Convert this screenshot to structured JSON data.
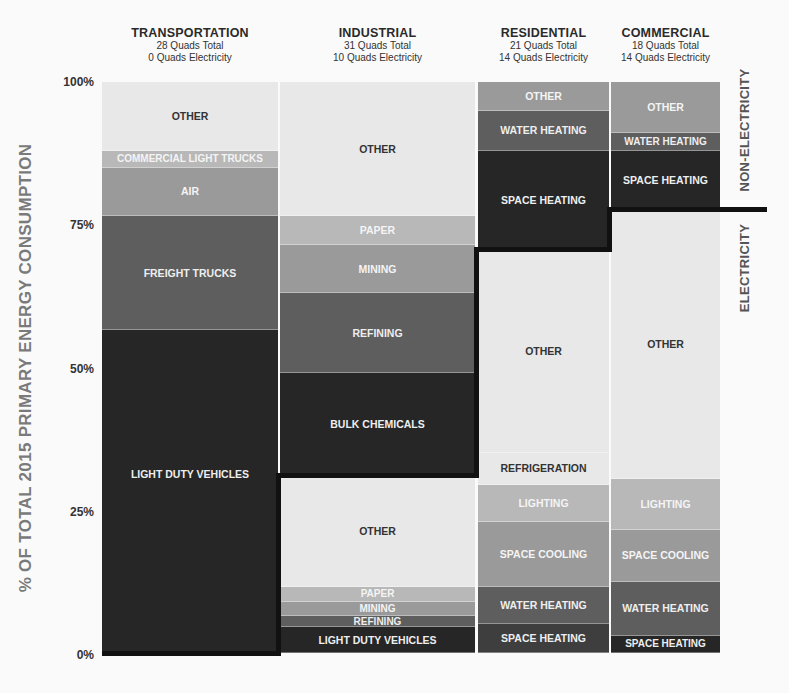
{
  "chart_data": {
    "type": "bar",
    "subtype": "marimekko (variable-width 100% stacked)",
    "title": "",
    "ylabel": "% OF TOTAL 2015 PRIMARY ENERGY CONSUMPTION",
    "xlabel": "",
    "ylim": [
      0,
      100
    ],
    "y_ticks": [
      "100%",
      "75%",
      "50%",
      "25%",
      "0%"
    ],
    "grid": false,
    "side_labels": {
      "upper": "NON-ELECTRICITY",
      "lower": "ELECTRICITY"
    },
    "categories": [
      "TRANSPORTATION",
      "INDUSTRIAL",
      "RESIDENTIAL",
      "COMMERCIAL"
    ],
    "columns": [
      {
        "name": "TRANSPORTATION",
        "total_label": "28 Quads Total",
        "electricity_label": "0 Quads Electricity",
        "total_quads": 28,
        "electricity_quads": 0,
        "electricity_split_pct": 0,
        "segments": [
          {
            "label": "OTHER",
            "group": "non-electricity",
            "from": 88,
            "to": 100
          },
          {
            "label": "COMMERCIAL LIGHT TRUCKS",
            "group": "non-electricity",
            "from": 85,
            "to": 88
          },
          {
            "label": "AIR",
            "group": "non-electricity",
            "from": 76.5,
            "to": 85
          },
          {
            "label": "FREIGHT TRUCKS",
            "group": "non-electricity",
            "from": 56.5,
            "to": 76.5
          },
          {
            "label": "LIGHT DUTY VEHICLES",
            "group": "non-electricity",
            "from": 0,
            "to": 56.5
          }
        ]
      },
      {
        "name": "INDUSTRIAL",
        "total_label": "31 Quads Total",
        "electricity_label": "10 Quads Electricity",
        "total_quads": 31,
        "electricity_quads": 10,
        "electricity_split_pct": 31,
        "segments": [
          {
            "label": "OTHER",
            "group": "non-electricity",
            "from": 76.5,
            "to": 100
          },
          {
            "label": "PAPER",
            "group": "non-electricity",
            "from": 71.5,
            "to": 76.5
          },
          {
            "label": "MINING",
            "group": "non-electricity",
            "from": 63,
            "to": 71.5
          },
          {
            "label": "REFINING",
            "group": "non-electricity",
            "from": 49,
            "to": 63
          },
          {
            "label": "BULK CHEMICALS",
            "group": "non-electricity",
            "from": 31,
            "to": 49
          },
          {
            "label": "OTHER",
            "group": "electricity",
            "from": 11.5,
            "to": 31
          },
          {
            "label": "PAPER",
            "group": "electricity",
            "from": 9,
            "to": 11.5
          },
          {
            "label": "MINING",
            "group": "electricity",
            "from": 6.5,
            "to": 9
          },
          {
            "label": "REFINING",
            "group": "electricity",
            "from": 4.5,
            "to": 6.5
          },
          {
            "label": "LIGHT DUTY VEHICLES",
            "group": "electricity",
            "from": 0,
            "to": 4.5
          }
        ]
      },
      {
        "name": "RESIDENTIAL",
        "total_label": "21 Quads Total",
        "electricity_label": "14 Quads Electricity",
        "total_quads": 21,
        "electricity_quads": 14,
        "electricity_split_pct": 70.5,
        "segments": [
          {
            "label": "OTHER",
            "group": "non-electricity",
            "from": 95,
            "to": 100
          },
          {
            "label": "WATER HEATING",
            "group": "non-electricity",
            "from": 88,
            "to": 95
          },
          {
            "label": "SPACE HEATING",
            "group": "non-electricity",
            "from": 70.5,
            "to": 88
          },
          {
            "label": "OTHER",
            "group": "electricity",
            "from": 35,
            "to": 70.5
          },
          {
            "label": "REFRIGERATION",
            "group": "electricity",
            "from": 29.5,
            "to": 35
          },
          {
            "label": "LIGHTING",
            "group": "electricity",
            "from": 23,
            "to": 29.5
          },
          {
            "label": "SPACE COOLING",
            "group": "electricity",
            "from": 11.5,
            "to": 23
          },
          {
            "label": "WATER HEATING",
            "group": "electricity",
            "from": 5,
            "to": 11.5
          },
          {
            "label": "SPACE HEATING",
            "group": "electricity",
            "from": 0,
            "to": 5
          }
        ]
      },
      {
        "name": "COMMERCIAL",
        "total_label": "18 Quads Total",
        "electricity_label": "14 Quads Electricity",
        "total_quads": 18,
        "electricity_quads": 14,
        "electricity_split_pct": 77.5,
        "segments": [
          {
            "label": "OTHER",
            "group": "non-electricity",
            "from": 91,
            "to": 100
          },
          {
            "label": "WATER HEATING",
            "group": "non-electricity",
            "from": 88,
            "to": 91
          },
          {
            "label": "SPACE HEATING",
            "group": "non-electricity",
            "from": 77.5,
            "to": 88
          },
          {
            "label": "OTHER",
            "group": "electricity",
            "from": 30.5,
            "to": 77.5
          },
          {
            "label": "LIGHTING",
            "group": "electricity",
            "from": 21.5,
            "to": 30.5
          },
          {
            "label": "SPACE COOLING",
            "group": "electricity",
            "from": 12.5,
            "to": 21.5
          },
          {
            "label": "WATER HEATING",
            "group": "electricity",
            "from": 3,
            "to": 12.5
          },
          {
            "label": "SPACE HEATING",
            "group": "electricity",
            "from": 0,
            "to": 3
          }
        ]
      }
    ]
  },
  "colors": {
    "other_light": "#e8e8e8",
    "light_gray": "#b8b8b8",
    "mid_gray": "#9a9a9a",
    "dark_gray": "#5e5e5e",
    "darker_gray": "#3e3e3e",
    "darkest": "#262626",
    "divider": "#111111"
  }
}
